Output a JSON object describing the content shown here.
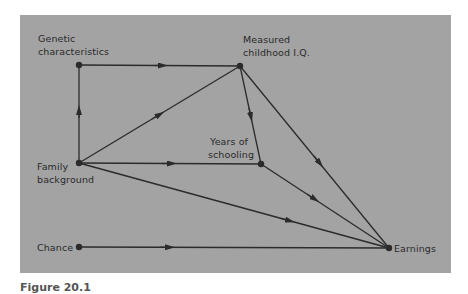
{
  "diagram": {
    "type": "path-diagram",
    "background_color": "#a3a3a3",
    "line_color": "#2b2b2b",
    "nodes": [
      {
        "id": "genetic",
        "label_line1": "Genetic",
        "label_line2": "characteristics"
      },
      {
        "id": "iq",
        "label_line1": "Measured",
        "label_line2": "childhood I.Q."
      },
      {
        "id": "family",
        "label_line1": "Family",
        "label_line2": "background"
      },
      {
        "id": "schooling",
        "label_line1": "Years of",
        "label_line2": "schooling"
      },
      {
        "id": "chance",
        "label_line1": "Chance"
      },
      {
        "id": "earnings",
        "label_line1": "Earnings"
      }
    ],
    "edges": [
      {
        "from": "family",
        "to": "genetic"
      },
      {
        "from": "genetic",
        "to": "iq"
      },
      {
        "from": "family",
        "to": "iq"
      },
      {
        "from": "family",
        "to": "schooling"
      },
      {
        "from": "iq",
        "to": "schooling"
      },
      {
        "from": "iq",
        "to": "earnings"
      },
      {
        "from": "schooling",
        "to": "earnings"
      },
      {
        "from": "family",
        "to": "earnings"
      },
      {
        "from": "chance",
        "to": "earnings"
      }
    ]
  },
  "caption": "Figure 20.1"
}
